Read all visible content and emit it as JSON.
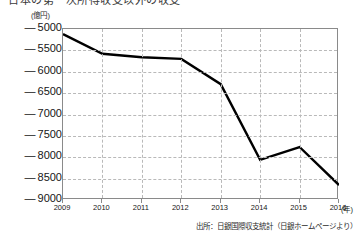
{
  "figure": {
    "title": "日本の第一次所得収支以外の収支",
    "source_note": "出所：日銀国際収支統計（日銀ホームページより）"
  },
  "chart_data": {
    "type": "line",
    "title": "日本の第一次所得収支以外の収支",
    "xlabel": "(年)",
    "ylabel": "(億円)",
    "yunit": "(億円)",
    "xunit": "(年)",
    "categories": [
      "2009",
      "2010",
      "2011",
      "2012",
      "2013",
      "2014",
      "2015",
      "2016"
    ],
    "values": [
      -5120,
      -5580,
      -5660,
      -5700,
      -6290,
      -8060,
      -7760,
      -8650
    ],
    "series": [
      {
        "name": "収支",
        "values": [
          -5120,
          -5580,
          -5660,
          -5700,
          -6290,
          -8060,
          -7760,
          -8650
        ]
      }
    ],
    "ylim": [
      -9000,
      -5000
    ],
    "yticks": [
      -5000,
      -5500,
      -6000,
      -6500,
      -7000,
      -7500,
      -8000,
      -8500,
      -9000
    ],
    "ytick_labels": [
      "5000",
      "5500",
      "6000",
      "6500",
      "7000",
      "7500",
      "8000",
      "8500",
      "9000"
    ],
    "ytick_sign": "—",
    "grid": true,
    "legend": "none",
    "line_color": "#000000",
    "grid_color": "#b9b9b9",
    "axis_color": "#8a8a8a"
  }
}
